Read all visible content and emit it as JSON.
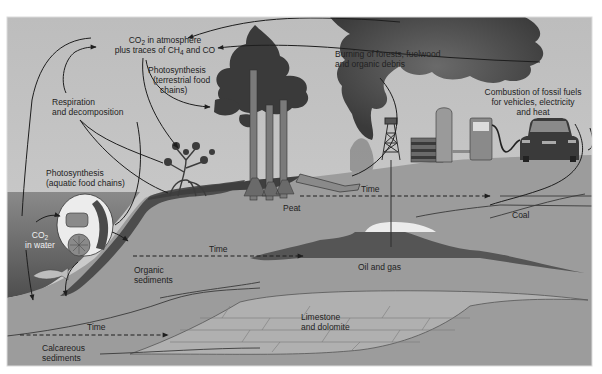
{
  "diagram": {
    "colors": {
      "frame_bg": "#b8b8b8",
      "sky": "#c9c9c9",
      "water": "#6e6e6e",
      "ground": "#9a9a9a",
      "dark_layer": "#5a5a5a",
      "smoke": "#4a4a4a",
      "tree": "#3c3c3c",
      "light": "#ececec",
      "line": "#222222"
    },
    "labels": {
      "co2_atmosphere_line1_pre": "CO",
      "co2_atmosphere_line1_sub": "2",
      "co2_atmosphere_line1_post": " in atmosphere",
      "co2_atmosphere_line2_pre": "plus traces of CH",
      "co2_atmosphere_line2_sub": "4",
      "co2_atmosphere_line2_post": " and CO",
      "photosynthesis_terrestrial_1": "Photosynthesis",
      "photosynthesis_terrestrial_2": "(terrestrial food",
      "photosynthesis_terrestrial_3": "chains)",
      "respiration_1": "Respiration",
      "respiration_2": "and decomposition",
      "photosynthesis_aquatic_1": "Photosynthesis",
      "photosynthesis_aquatic_2": "(aquatic food chains)",
      "co2_water_pre": "CO",
      "co2_water_sub": "2",
      "co2_water_2": "in water",
      "burning_1": "Burning of forests, fuelwood",
      "burning_2": "and organic debris",
      "combustion_1": "Combustion of fossil fuels",
      "combustion_2": "for vehicles, electricity",
      "combustion_3": "and heat",
      "peat": "Peat",
      "coal": "Coal",
      "time_peat": "Time",
      "time_organic": "Time",
      "time_calcareous": "Time",
      "organic_sediments_1": "Organic",
      "organic_sediments_2": "sediments",
      "oil_and_gas": "Oil and gas",
      "limestone_1": "Limestone",
      "limestone_2": "and dolomite",
      "calcareous_1": "Calcareous",
      "calcareous_2": "sediments"
    }
  }
}
